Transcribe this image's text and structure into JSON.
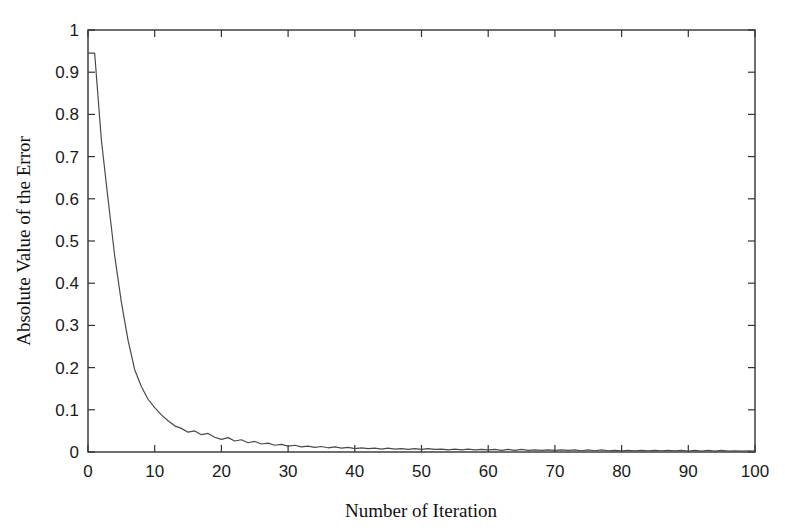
{
  "chart_data": {
    "type": "line",
    "title": "",
    "xlabel": "Number of Iteration",
    "ylabel": "Absolute Value of the Error",
    "xlim": [
      0,
      100
    ],
    "ylim": [
      0,
      1
    ],
    "xticks": [
      0,
      10,
      20,
      30,
      40,
      50,
      60,
      70,
      80,
      90,
      100
    ],
    "yticks": [
      0,
      0.1,
      0.2,
      0.3,
      0.4,
      0.5,
      0.6,
      0.7,
      0.8,
      0.9,
      1
    ],
    "xtick_labels": [
      "0",
      "10",
      "20",
      "30",
      "40",
      "50",
      "60",
      "70",
      "80",
      "90",
      "100"
    ],
    "ytick_labels": [
      "0",
      "0.1",
      "0.2",
      "0.3",
      "0.4",
      "0.5",
      "0.6",
      "0.7",
      "0.8",
      "0.9",
      "1"
    ],
    "grid": false,
    "legend": null,
    "line_color": "#4a4a4a",
    "axis_color": "#333333",
    "background_color": "#ffffff",
    "series": [
      {
        "name": "Absolute Value of the Error",
        "x": [
          0,
          1,
          2,
          3,
          4,
          5,
          6,
          7,
          8,
          9,
          10,
          11,
          12,
          13,
          14,
          15,
          16,
          17,
          18,
          19,
          20,
          21,
          22,
          23,
          24,
          25,
          26,
          27,
          28,
          29,
          30,
          31,
          32,
          33,
          34,
          35,
          36,
          37,
          38,
          39,
          40,
          41,
          42,
          43,
          44,
          45,
          46,
          47,
          48,
          49,
          50,
          51,
          52,
          53,
          54,
          55,
          56,
          57,
          58,
          59,
          60,
          61,
          62,
          63,
          64,
          65,
          66,
          67,
          68,
          69,
          70,
          71,
          72,
          73,
          74,
          75,
          76,
          77,
          78,
          79,
          80,
          81,
          82,
          83,
          84,
          85,
          86,
          87,
          88,
          89,
          90,
          91,
          92,
          93,
          94,
          95,
          96,
          97,
          98,
          99,
          100
        ],
        "y": [
          0.945,
          0.945,
          0.74,
          0.6,
          0.465,
          0.355,
          0.265,
          0.195,
          0.155,
          0.125,
          0.105,
          0.088,
          0.074,
          0.062,
          0.056,
          0.047,
          0.05,
          0.041,
          0.044,
          0.035,
          0.03,
          0.034,
          0.026,
          0.029,
          0.022,
          0.025,
          0.019,
          0.021,
          0.016,
          0.018,
          0.014,
          0.016,
          0.012,
          0.014,
          0.011,
          0.013,
          0.01,
          0.012,
          0.009,
          0.011,
          0.008,
          0.01,
          0.008,
          0.009,
          0.007,
          0.009,
          0.007,
          0.008,
          0.006,
          0.008,
          0.006,
          0.008,
          0.006,
          0.007,
          0.005,
          0.007,
          0.005,
          0.007,
          0.005,
          0.006,
          0.005,
          0.006,
          0.004,
          0.006,
          0.004,
          0.006,
          0.004,
          0.005,
          0.004,
          0.005,
          0.004,
          0.005,
          0.004,
          0.005,
          0.003,
          0.005,
          0.003,
          0.005,
          0.003,
          0.004,
          0.003,
          0.004,
          0.003,
          0.004,
          0.003,
          0.004,
          0.003,
          0.004,
          0.003,
          0.004,
          0.002,
          0.004,
          0.002,
          0.004,
          0.002,
          0.004,
          0.002,
          0.003,
          0.002,
          0.003,
          0.002
        ]
      }
    ]
  },
  "plot_geometry": {
    "left": 88,
    "right": 755,
    "top": 30,
    "bottom": 452
  }
}
